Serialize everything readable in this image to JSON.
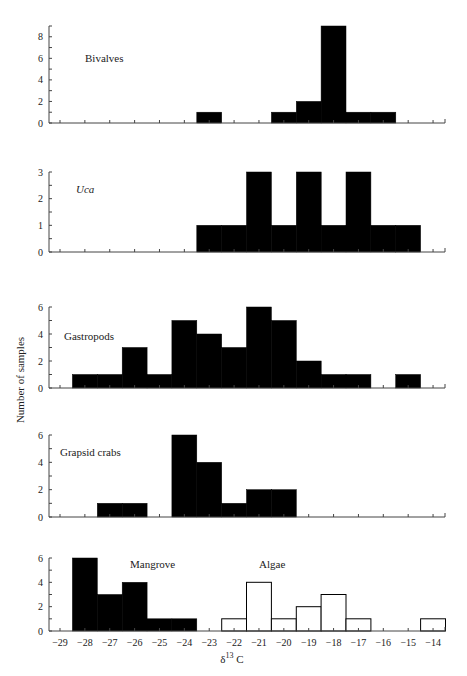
{
  "figure": {
    "ylabel": "Number of samples",
    "xlabel_main": "δ",
    "xlabel_sup": "13",
    "xlabel_tail": " C",
    "xticks": [
      -29,
      -28,
      -27,
      -26,
      -25,
      -24,
      -23,
      -22,
      -21,
      -20,
      -19,
      -18,
      -17,
      -16,
      -15,
      -14
    ],
    "xtick_labels": [
      "−29",
      "−28",
      "−27",
      "−26",
      "−25",
      "−24",
      "−23",
      "−22",
      "−21",
      "−20",
      "−19",
      "−18",
      "−17",
      "−16",
      "−15",
      "−14"
    ]
  },
  "chart_data": [
    {
      "type": "bar",
      "title": "Bivalves",
      "xlabel": "δ13C",
      "ylabel": "Number of samples",
      "ylim": [
        0,
        9
      ],
      "yticks": [
        0,
        2,
        4,
        6,
        8
      ],
      "bin_width": 1,
      "series": [
        {
          "name": "Bivalves",
          "fill": "#000000",
          "bins": [
            {
              "x": -23,
              "count": 1
            },
            {
              "x": -20,
              "count": 1
            },
            {
              "x": -19,
              "count": 2
            },
            {
              "x": -18,
              "count": 9
            },
            {
              "x": -17,
              "count": 1
            },
            {
              "x": -16,
              "count": 1
            }
          ]
        }
      ]
    },
    {
      "type": "bar",
      "title": "Uca",
      "xlabel": "δ13C",
      "ylabel": "Number of samples",
      "ylim": [
        0,
        3
      ],
      "yticks": [
        0,
        1,
        2,
        3
      ],
      "bin_width": 1,
      "series": [
        {
          "name": "Uca",
          "fill": "#000000",
          "bins": [
            {
              "x": -23,
              "count": 1
            },
            {
              "x": -22,
              "count": 1
            },
            {
              "x": -21,
              "count": 3
            },
            {
              "x": -20,
              "count": 1
            },
            {
              "x": -19,
              "count": 3
            },
            {
              "x": -18,
              "count": 1
            },
            {
              "x": -17,
              "count": 3
            },
            {
              "x": -16,
              "count": 1
            },
            {
              "x": -15,
              "count": 1
            }
          ]
        }
      ]
    },
    {
      "type": "bar",
      "title": "Gastropods",
      "xlabel": "δ13C",
      "ylabel": "Number of samples",
      "ylim": [
        0,
        6
      ],
      "yticks": [
        0,
        2,
        4,
        6
      ],
      "bin_width": 1,
      "series": [
        {
          "name": "Gastropods",
          "fill": "#000000",
          "bins": [
            {
              "x": -28,
              "count": 1
            },
            {
              "x": -27,
              "count": 1
            },
            {
              "x": -26,
              "count": 3
            },
            {
              "x": -25,
              "count": 1
            },
            {
              "x": -24,
              "count": 5
            },
            {
              "x": -23,
              "count": 4
            },
            {
              "x": -22,
              "count": 3
            },
            {
              "x": -21,
              "count": 6
            },
            {
              "x": -20,
              "count": 5
            },
            {
              "x": -19,
              "count": 2
            },
            {
              "x": -18,
              "count": 1
            },
            {
              "x": -17,
              "count": 1
            },
            {
              "x": -15,
              "count": 1
            }
          ]
        }
      ]
    },
    {
      "type": "bar",
      "title": "Grapsid crabs",
      "xlabel": "δ13C",
      "ylabel": "Number of samples",
      "ylim": [
        0,
        6
      ],
      "yticks": [
        0,
        2,
        4,
        6
      ],
      "bin_width": 1,
      "series": [
        {
          "name": "Grapsid crabs",
          "fill": "#000000",
          "bins": [
            {
              "x": -27,
              "count": 1
            },
            {
              "x": -26,
              "count": 1
            },
            {
              "x": -24,
              "count": 6
            },
            {
              "x": -23,
              "count": 4
            },
            {
              "x": -22,
              "count": 1
            },
            {
              "x": -21,
              "count": 2
            },
            {
              "x": -20,
              "count": 2
            }
          ]
        }
      ]
    },
    {
      "type": "bar",
      "title": "Mangrove / Algae",
      "xlabel": "δ13C",
      "ylabel": "Number of samples",
      "ylim": [
        0,
        6
      ],
      "yticks": [
        0,
        2,
        4,
        6
      ],
      "bin_width": 1,
      "series": [
        {
          "name": "Mangrove",
          "fill": "#000000",
          "bins": [
            {
              "x": -28,
              "count": 6
            },
            {
              "x": -27,
              "count": 3
            },
            {
              "x": -26,
              "count": 4
            },
            {
              "x": -25,
              "count": 1
            },
            {
              "x": -24,
              "count": 1
            }
          ]
        },
        {
          "name": "Algae",
          "fill": "#ffffff",
          "bins": [
            {
              "x": -22,
              "count": 1
            },
            {
              "x": -21,
              "count": 4
            },
            {
              "x": -20,
              "count": 1
            },
            {
              "x": -19,
              "count": 2
            },
            {
              "x": -18,
              "count": 3
            },
            {
              "x": -17,
              "count": 1
            },
            {
              "x": -14,
              "count": 1
            }
          ]
        }
      ]
    }
  ],
  "panels_layout": [
    {
      "label": "Bivalves",
      "italic": false,
      "label_x": 85,
      "label_y": 62,
      "y0": 123,
      "ytop": 26,
      "ymax": 9,
      "minor_step": 1
    },
    {
      "label": "Uca",
      "italic": true,
      "label_x": 76,
      "label_y": 193,
      "y0": 252,
      "ytop": 172,
      "ymax": 3,
      "minor_step": 0.5
    },
    {
      "label": "Gastropods",
      "italic": false,
      "label_x": 64,
      "label_y": 340,
      "y0": 388,
      "ytop": 307,
      "ymax": 6,
      "minor_step": 1
    },
    {
      "label": "Grapsid crabs",
      "italic": false,
      "label_x": 60,
      "label_y": 456,
      "y0": 517,
      "ytop": 435,
      "ymax": 6,
      "minor_step": 1
    },
    {
      "label": "Mangrove",
      "italic": false,
      "label_x": 130,
      "label_y": 568,
      "y0": 631,
      "ytop": 558,
      "ymax": 6,
      "minor_step": 1,
      "label2": "Algae",
      "label2_x": 259,
      "label2_y": 568
    }
  ]
}
